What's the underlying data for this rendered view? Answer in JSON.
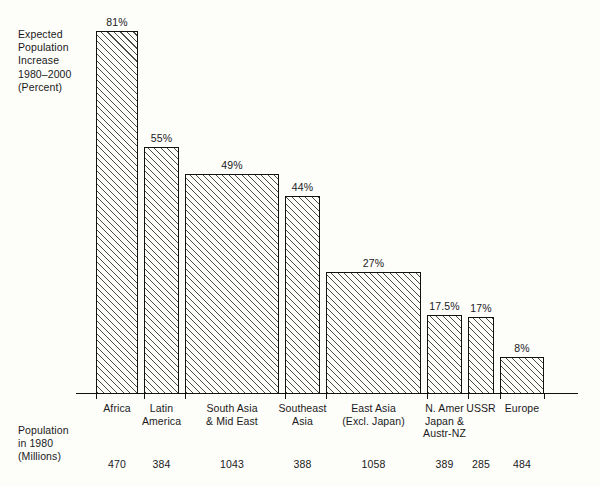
{
  "axis_labels": {
    "y_title": "Expected\nPopulation\nIncrease\n1980–2000\n(Percent)",
    "population_title": "Population\nin 1980\n(Millions)"
  },
  "chart_data": {
    "type": "bar",
    "title": "",
    "subtitle": "",
    "xlabel": "",
    "ylabel": "Expected Population Increase 1980-2000 (Percent)",
    "ylim": [
      0,
      81
    ],
    "grid": false,
    "legend": "none",
    "note": "Bar widths are proportional to 1980 population (millions); bar heights are the expected percent increase 1980-2000.",
    "categories": [
      "Africa",
      "Latin\nAmerica",
      "South Asia\n& Mid East",
      "Southeast\nAsia",
      "East Asia\n(Excl. Japan)",
      "N. Amer\nJapan &\nAustr-NZ",
      "USSR",
      "Europe"
    ],
    "values": [
      81,
      55,
      49,
      44,
      27,
      17.5,
      17,
      8
    ],
    "value_labels": [
      "81%",
      "55%",
      "49%",
      "44%",
      "27%",
      "17.5%",
      "17%",
      "8%"
    ],
    "widths": [
      470,
      384,
      1043,
      388,
      1058,
      389,
      285,
      484
    ],
    "width_labels": [
      "470",
      "384",
      "1043",
      "388",
      "1058",
      "389",
      "285",
      "484"
    ]
  },
  "colors": {
    "background": "#fdfdfa",
    "ink": "#111111",
    "hatch": "#4a4a4a"
  }
}
